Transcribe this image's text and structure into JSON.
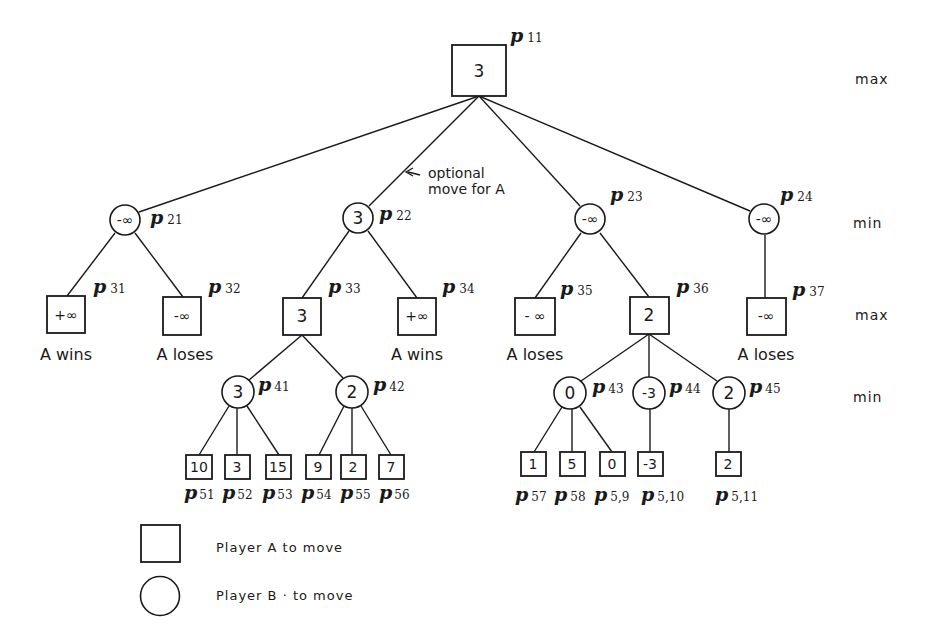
{
  "diagram": {
    "type": "game-tree",
    "level_labels": [
      {
        "id": "level-1",
        "text": "max",
        "y": 80
      },
      {
        "id": "level-2",
        "text": "min",
        "y": 224
      },
      {
        "id": "level-3",
        "text": "max",
        "y": 320
      },
      {
        "id": "level-4",
        "text": "min",
        "y": 398
      }
    ],
    "annotation": {
      "line1": "optional",
      "line2": "move for A"
    },
    "nodes": {
      "p11": {
        "label": "p",
        "sub": "11",
        "value": "3",
        "shape": "square"
      },
      "p21": {
        "label": "p",
        "sub": "21",
        "value": "-∞",
        "shape": "circle"
      },
      "p22": {
        "label": "p",
        "sub": "22",
        "value": "3",
        "shape": "circle"
      },
      "p23": {
        "label": "p",
        "sub": "23",
        "value": "-∞",
        "shape": "circle"
      },
      "p24": {
        "label": "p",
        "sub": "24",
        "value": "-∞",
        "shape": "circle"
      },
      "p31": {
        "label": "p",
        "sub": "31",
        "value": "+∞",
        "shape": "square",
        "outcome": "A wins"
      },
      "p32": {
        "label": "p",
        "sub": "32",
        "value": "-∞",
        "shape": "square",
        "outcome": "A loses"
      },
      "p33": {
        "label": "p",
        "sub": "33",
        "value": "3",
        "shape": "square"
      },
      "p34": {
        "label": "p",
        "sub": "34",
        "value": "+∞",
        "shape": "square",
        "outcome": "A wins"
      },
      "p35": {
        "label": "p",
        "sub": "35",
        "value": "- ∞",
        "shape": "square",
        "outcome": "A loses"
      },
      "p36": {
        "label": "p",
        "sub": "36",
        "value": "2",
        "shape": "square"
      },
      "p37": {
        "label": "p",
        "sub": "37",
        "value": "-∞",
        "shape": "square",
        "outcome": "A loses"
      },
      "p41": {
        "label": "p",
        "sub": "41",
        "value": "3",
        "shape": "circle"
      },
      "p42": {
        "label": "p",
        "sub": "42",
        "value": "2",
        "shape": "circle"
      },
      "p43": {
        "label": "p",
        "sub": "43",
        "value": "0",
        "shape": "circle"
      },
      "p44": {
        "label": "p",
        "sub": "44",
        "value": "-3",
        "shape": "circle"
      },
      "p45": {
        "label": "p",
        "sub": "45",
        "value": "2",
        "shape": "circle"
      },
      "p51": {
        "label": "p",
        "sub": "51",
        "value": "10",
        "shape": "square"
      },
      "p52": {
        "label": "p",
        "sub": "52",
        "value": "3",
        "shape": "square"
      },
      "p53": {
        "label": "p",
        "sub": "53",
        "value": "15",
        "shape": "square"
      },
      "p54": {
        "label": "p",
        "sub": "54",
        "value": "9",
        "shape": "square"
      },
      "p55": {
        "label": "p",
        "sub": "55",
        "value": "2",
        "shape": "square"
      },
      "p56": {
        "label": "p",
        "sub": "56",
        "value": "7",
        "shape": "square"
      },
      "p57": {
        "label": "p",
        "sub": "57",
        "value": "1",
        "shape": "square"
      },
      "p58": {
        "label": "p",
        "sub": "58",
        "value": "5",
        "shape": "square"
      },
      "p59": {
        "label": "p",
        "sub": "5,9",
        "value": "0",
        "shape": "square"
      },
      "p510": {
        "label": "p",
        "sub": "5,10",
        "value": "-3",
        "shape": "square"
      },
      "p511": {
        "label": "p",
        "sub": "5,11",
        "value": "2",
        "shape": "square"
      }
    },
    "edges": [
      [
        "p11",
        "p21"
      ],
      [
        "p11",
        "p22"
      ],
      [
        "p11",
        "p23"
      ],
      [
        "p11",
        "p24"
      ],
      [
        "p21",
        "p31"
      ],
      [
        "p21",
        "p32"
      ],
      [
        "p22",
        "p33"
      ],
      [
        "p22",
        "p34"
      ],
      [
        "p23",
        "p35"
      ],
      [
        "p23",
        "p36"
      ],
      [
        "p24",
        "p37"
      ],
      [
        "p33",
        "p41"
      ],
      [
        "p33",
        "p42"
      ],
      [
        "p36",
        "p43"
      ],
      [
        "p36",
        "p44"
      ],
      [
        "p36",
        "p45"
      ],
      [
        "p41",
        "p51"
      ],
      [
        "p41",
        "p52"
      ],
      [
        "p41",
        "p53"
      ],
      [
        "p42",
        "p54"
      ],
      [
        "p42",
        "p55"
      ],
      [
        "p42",
        "p56"
      ],
      [
        "p43",
        "p57"
      ],
      [
        "p43",
        "p58"
      ],
      [
        "p43",
        "p59"
      ],
      [
        "p44",
        "p510"
      ],
      [
        "p45",
        "p511"
      ]
    ]
  },
  "legend": {
    "items": [
      {
        "shape": "square",
        "text": "Player  A  to  move"
      },
      {
        "shape": "circle",
        "text": "Player  B · to  move"
      }
    ]
  }
}
